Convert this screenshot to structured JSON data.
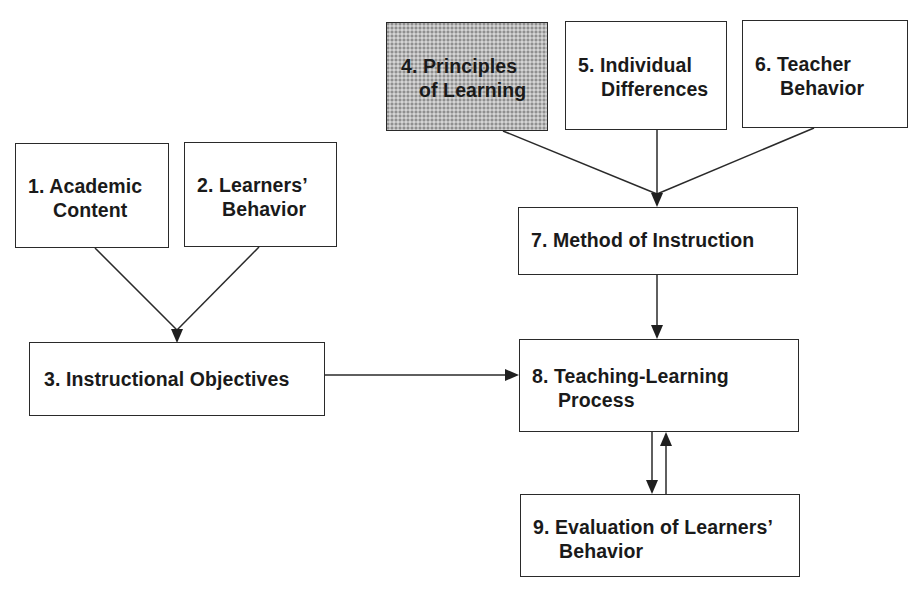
{
  "diagram": {
    "type": "flowchart",
    "shaded_color": "#b9b9b9",
    "nodes": [
      {
        "id": 1,
        "number": "1.",
        "lines": [
          "1. Academic",
          "Content"
        ],
        "shaded": false
      },
      {
        "id": 2,
        "number": "2.",
        "lines": [
          "2. Learners’",
          "Behavior"
        ],
        "shaded": false
      },
      {
        "id": 3,
        "number": "3.",
        "lines": [
          "3. Instructional Objectives"
        ],
        "shaded": false
      },
      {
        "id": 4,
        "number": "4.",
        "lines": [
          "4. Principles",
          "of Learning"
        ],
        "shaded": true
      },
      {
        "id": 5,
        "number": "5.",
        "lines": [
          "5. Individual",
          "Differences"
        ],
        "shaded": false
      },
      {
        "id": 6,
        "number": "6.",
        "lines": [
          "6. Teacher",
          "Behavior"
        ],
        "shaded": false
      },
      {
        "id": 7,
        "number": "7.",
        "lines": [
          "7. Method of Instruction"
        ],
        "shaded": false
      },
      {
        "id": 8,
        "number": "8.",
        "lines": [
          "8. Teaching-Learning",
          "Process"
        ],
        "shaded": false
      },
      {
        "id": 9,
        "number": "9.",
        "lines": [
          "9. Evaluation of Learners’",
          "Behavior"
        ],
        "shaded": false
      }
    ],
    "edges": [
      {
        "from": 1,
        "to": 3
      },
      {
        "from": 2,
        "to": 3
      },
      {
        "from": 3,
        "to": 8
      },
      {
        "from": 4,
        "to": 7
      },
      {
        "from": 5,
        "to": 7
      },
      {
        "from": 6,
        "to": 7
      },
      {
        "from": 7,
        "to": 8
      },
      {
        "from": 8,
        "to": 9
      },
      {
        "from": 9,
        "to": 8
      }
    ]
  },
  "labels": {
    "box1_line1": "1. Academic",
    "box1_line2": "Content",
    "box2_line1": "2. Learners’",
    "box2_line2": "Behavior",
    "box3_line1": "3. Instructional Objectives",
    "box4_line1": "4. Principles",
    "box4_line2": "of Learning",
    "box5_line1": "5. Individual",
    "box5_line2": "Differences",
    "box6_line1": "6. Teacher",
    "box6_line2": "Behavior",
    "box7_line1": "7. Method of Instruction",
    "box8_line1": "8. Teaching-Learning",
    "box8_line2": "Process",
    "box9_line1": "9. Evaluation of Learners’",
    "box9_line2": "Behavior"
  }
}
